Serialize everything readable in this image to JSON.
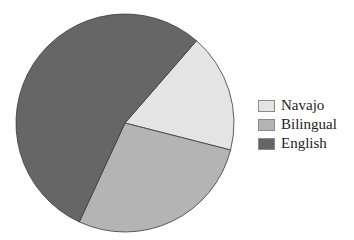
{
  "chart_data": {
    "type": "pie",
    "title": "",
    "start_angle_deg": 49,
    "direction": "clockwise",
    "slices": [
      {
        "label": "Navajo",
        "value": 17.6,
        "color": "#e4e4e4"
      },
      {
        "label": "Bilingual",
        "value": 27.9,
        "color": "#b4b4b4"
      },
      {
        "label": "English",
        "value": 54.5,
        "color": "#666666"
      }
    ],
    "legend": {
      "position": "right",
      "entries": [
        "Navajo",
        "Bilingual",
        "English"
      ]
    }
  }
}
